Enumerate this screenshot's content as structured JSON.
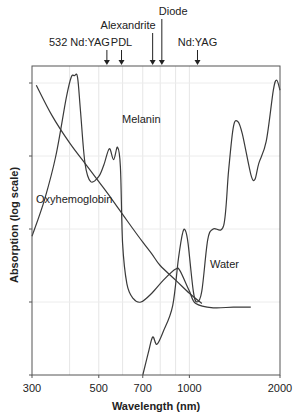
{
  "chart_data": {
    "type": "line",
    "title": "",
    "xlabel": "Wavelength (nm)",
    "ylabel": "Absorption (log scale)",
    "x_scale": "log",
    "y_scale": "log",
    "xlim": [
      300,
      2000
    ],
    "ylim_decades": [
      0,
      4.2
    ],
    "x_ticks": [
      300,
      500,
      700,
      1000,
      2000
    ],
    "x_tick_labels": [
      "300",
      "500",
      "700",
      "1000",
      "2000"
    ],
    "y_ticks_decades": [
      0,
      1,
      2,
      3,
      4
    ],
    "y_tick_labels": [
      "",
      "",
      "",
      "",
      ""
    ],
    "grid": true,
    "x_gridlines": [
      400,
      500,
      600,
      700,
      800,
      900,
      1000
    ],
    "legend": "none (inline labels)",
    "laser_markers": [
      {
        "label": "532 Nd:YAG",
        "wavelength": 532
      },
      {
        "label": "PDL",
        "wavelength": 595
      },
      {
        "label": "Alexandrite",
        "wavelength": 755
      },
      {
        "label": "Diode",
        "wavelength": 810
      },
      {
        "label": "Nd:YAG",
        "wavelength": 1064
      }
    ],
    "series": [
      {
        "name": "Melanin",
        "label_at": {
          "wavelength": 560,
          "level": 2.95
        },
        "points": [
          [
            310,
            3.97
          ],
          [
            350,
            3.55
          ],
          [
            400,
            3.18
          ],
          [
            450,
            2.9
          ],
          [
            500,
            2.65
          ],
          [
            550,
            2.42
          ],
          [
            600,
            2.2
          ],
          [
            650,
            2.0
          ],
          [
            700,
            1.82
          ],
          [
            750,
            1.66
          ],
          [
            800,
            1.5
          ],
          [
            900,
            1.3
          ],
          [
            1000,
            1.12
          ],
          [
            1100,
            0.98
          ],
          [
            1200,
            1.9
          ]
        ]
      },
      {
        "name": "Oxyhemoglobin",
        "label_at": {
          "wavelength": 390,
          "level": 2.3
        },
        "points": [
          [
            300,
            1.9
          ],
          [
            330,
            2.4
          ],
          [
            360,
            3.0
          ],
          [
            390,
            3.8
          ],
          [
            405,
            4.08
          ],
          [
            415,
            4.1
          ],
          [
            425,
            4.08
          ],
          [
            435,
            3.6
          ],
          [
            450,
            2.9
          ],
          [
            470,
            2.65
          ],
          [
            500,
            2.72
          ],
          [
            520,
            2.88
          ],
          [
            542,
            3.1
          ],
          [
            560,
            2.95
          ],
          [
            577,
            3.12
          ],
          [
            590,
            2.85
          ],
          [
            600,
            1.8
          ],
          [
            620,
            1.25
          ],
          [
            650,
            1.05
          ],
          [
            690,
            1.0
          ],
          [
            750,
            1.12
          ],
          [
            820,
            1.3
          ],
          [
            900,
            1.45
          ],
          [
            930,
            1.43
          ],
          [
            1000,
            1.15
          ],
          [
            1050,
            0.98
          ],
          [
            1200,
            0.92
          ],
          [
            1400,
            0.93
          ],
          [
            1600,
            0.93
          ]
        ]
      },
      {
        "name": "Water",
        "label_at": {
          "wavelength": 1150,
          "level": 1.05
        },
        "points": [
          [
            700,
            0.0
          ],
          [
            730,
            0.3
          ],
          [
            755,
            0.52
          ],
          [
            780,
            0.42
          ],
          [
            820,
            0.6
          ],
          [
            880,
            0.95
          ],
          [
            920,
            1.6
          ],
          [
            950,
            1.95
          ],
          [
            970,
            1.98
          ],
          [
            990,
            1.8
          ],
          [
            1030,
            1.15
          ],
          [
            1060,
            1.0
          ],
          [
            1100,
            1.15
          ],
          [
            1150,
            1.85
          ],
          [
            1200,
            2.0
          ],
          [
            1300,
            2.05
          ],
          [
            1350,
            2.8
          ],
          [
            1400,
            3.4
          ],
          [
            1450,
            3.47
          ],
          [
            1500,
            3.3
          ],
          [
            1600,
            2.75
          ],
          [
            1650,
            2.68
          ],
          [
            1700,
            2.9
          ],
          [
            1800,
            3.2
          ],
          [
            1900,
            3.9
          ],
          [
            1950,
            4.04
          ],
          [
            2000,
            3.9
          ]
        ]
      }
    ]
  },
  "labels": {
    "xlabel": "Wavelength (nm)",
    "ylabel": "Absorption (log scale)"
  }
}
